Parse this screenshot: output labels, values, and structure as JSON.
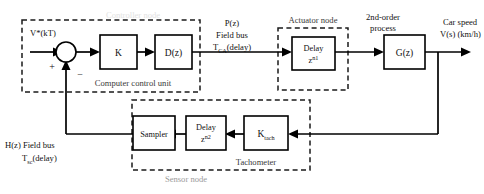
{
  "diagram": {
    "blocks": [
      {
        "id": "gain",
        "label": "K",
        "sub": ""
      },
      {
        "id": "dz",
        "label": "D(z)",
        "sub": ""
      },
      {
        "id": "delay1",
        "label": "Delay",
        "sub": "z",
        "sup": "n1"
      },
      {
        "id": "gz",
        "label": "G(z)",
        "sub": ""
      },
      {
        "id": "ktach",
        "label": "K",
        "sub": "tach"
      },
      {
        "id": "delay2",
        "label": "Delay",
        "sub": "z",
        "sup": "n2"
      },
      {
        "id": "sampler",
        "label": "Sampler",
        "sub": ""
      }
    ],
    "group_labels": {
      "controller_node": "Controller node",
      "computer_control_unit": "Computer control unit",
      "actuator_node": "Actuator node",
      "sensor_node": "Sensor node",
      "tachometer": "Tachometer"
    },
    "signals": {
      "reference": "V*(kT)",
      "forward_bus_line1": "P(z)",
      "forward_bus_line2": "Field bus",
      "forward_bus_line3_base": "T",
      "forward_bus_line3_sub": "CA",
      "forward_bus_line3_tail": "(delay)",
      "process_line1": "2nd-order",
      "process_line2": "process",
      "output_line1": "Car speed",
      "output_line2": "V(s) (km/h)",
      "feedback_bus_line1": "H(z) Field bus",
      "feedback_bus_line2_base": "T",
      "feedback_bus_line2_sub": "sc",
      "feedback_bus_line2_tail": "(delay)",
      "sum_plus": "+",
      "sum_minus": "−"
    },
    "colors": {
      "line": "#000000",
      "dashed": "#1a1a1a",
      "node_label": "#9b9b9b",
      "node_label_dark": "#3a3a3a",
      "background": "#ffffff"
    }
  }
}
